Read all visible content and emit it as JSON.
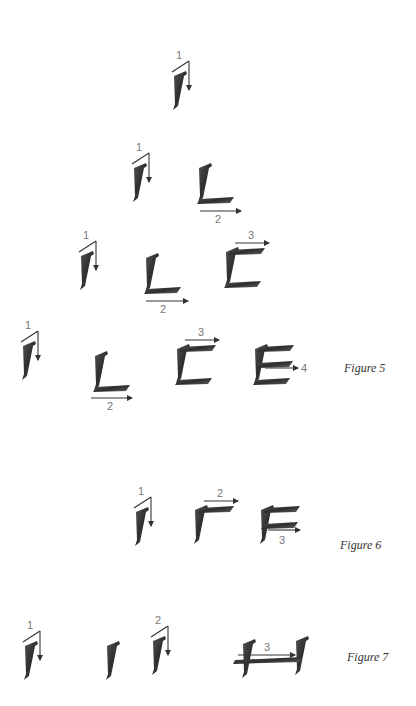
{
  "page": {
    "ink_color": "#3a3a3a",
    "arrow_color": "#444444"
  },
  "rows": [
    {
      "id": "row1",
      "glyphs": [
        {
          "letter": "I-stroke",
          "step": "1"
        }
      ]
    },
    {
      "id": "row2",
      "glyphs": [
        {
          "letter": "I-stroke",
          "step": "1"
        },
        {
          "letter": "L",
          "step": "2"
        }
      ]
    },
    {
      "id": "row3",
      "glyphs": [
        {
          "letter": "I-stroke",
          "step": "1"
        },
        {
          "letter": "L",
          "step": "2"
        },
        {
          "letter": "C-form",
          "step": "3"
        }
      ]
    },
    {
      "id": "row4",
      "caption": "Figure 5",
      "glyphs": [
        {
          "letter": "I-stroke",
          "step": "1"
        },
        {
          "letter": "L",
          "step": "2"
        },
        {
          "letter": "C-form",
          "step": "3"
        },
        {
          "letter": "E",
          "step": "4"
        }
      ]
    },
    {
      "id": "row5",
      "caption": "Figure 6",
      "glyphs": [
        {
          "letter": "I-stroke",
          "step": "1"
        },
        {
          "letter": "F-top",
          "step": "2"
        },
        {
          "letter": "F",
          "step": "3"
        }
      ]
    },
    {
      "id": "row6",
      "caption": "Figure 7",
      "glyphs": [
        {
          "letter": "I-stroke",
          "step": "1"
        },
        {
          "letter": "I-stroke",
          "step": ""
        },
        {
          "letter": "I-stroke",
          "step": "2"
        },
        {
          "letter": "H",
          "step": "3"
        }
      ]
    }
  ],
  "captions": {
    "fig5": "Figure 5",
    "fig6": "Figure 6",
    "fig7": "Figure 7"
  },
  "labels": {
    "r1_1": "1",
    "r2_1": "1",
    "r2_2": "2",
    "r3_1": "1",
    "r3_2": "2",
    "r3_3": "3",
    "r4_1": "1",
    "r4_2": "2",
    "r4_3": "3",
    "r4_4": "4",
    "r5_1": "1",
    "r5_2": "2",
    "r5_3": "3",
    "r6_1": "1",
    "r6_2": "2",
    "r6_3": "3"
  }
}
